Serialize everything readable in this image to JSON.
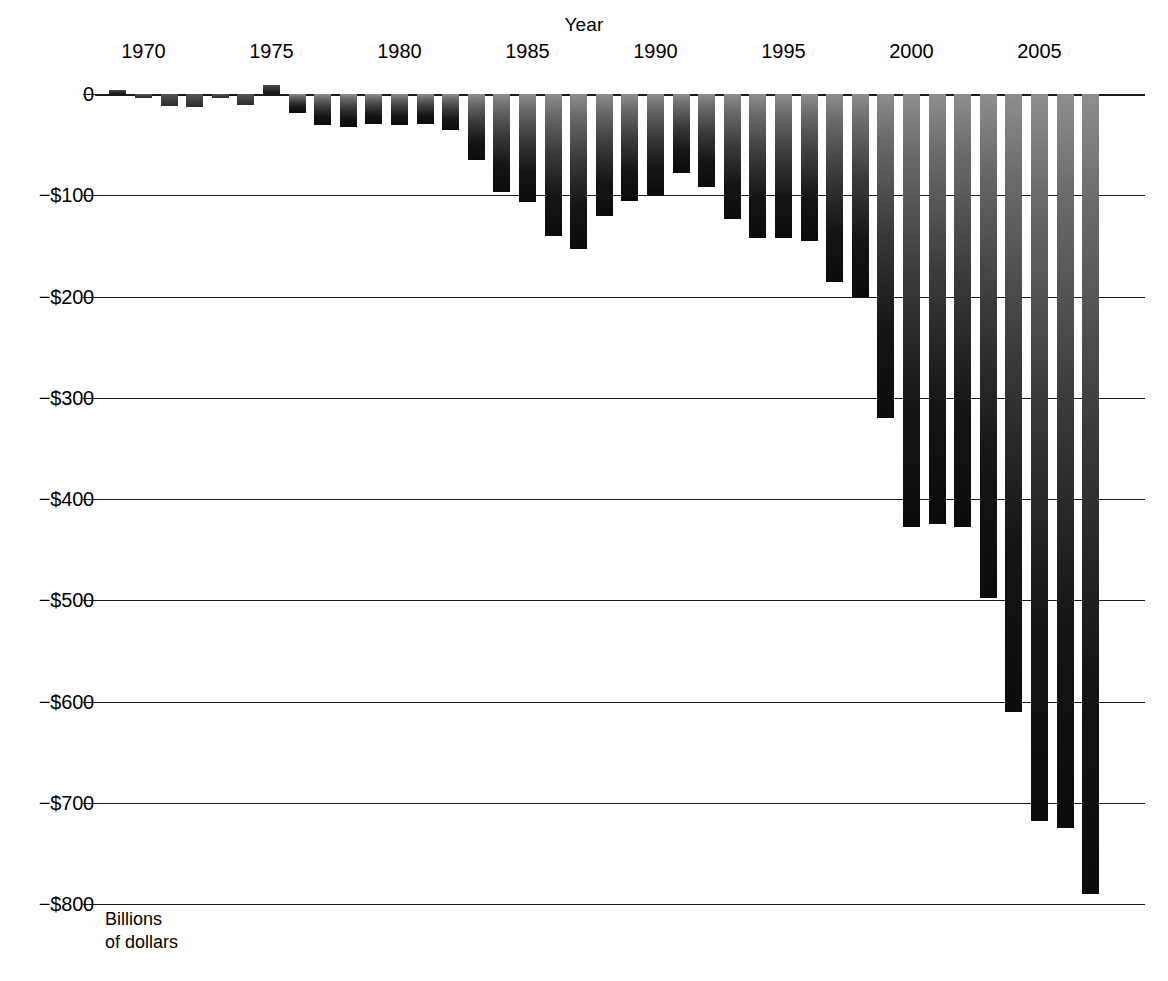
{
  "chart_data": {
    "type": "bar",
    "title": "",
    "xlabel": "Year",
    "ylabel": "Billions\nof dollars",
    "ylim": [
      -800,
      0
    ],
    "xlim": [
      1968.5,
      2007.5
    ],
    "grid": true,
    "legend": false,
    "legend_position": "none",
    "unit": "Billions of dollars",
    "y_ticks": [
      0,
      -100,
      -200,
      -300,
      -400,
      -500,
      -600,
      -700,
      -800
    ],
    "y_tick_labels": [
      "0",
      "−$100",
      "−$200",
      "−$300",
      "−$400",
      "−$500",
      "−$600",
      "−$700",
      "−$800"
    ],
    "x_ticks": [
      1970,
      1975,
      1980,
      1985,
      1990,
      1995,
      2000,
      2005
    ],
    "x_tick_labels": [
      "1970",
      "1975",
      "1980",
      "1985",
      "1990",
      "1995",
      "2000",
      "2005"
    ],
    "categories": [
      1969,
      1970,
      1971,
      1972,
      1973,
      1974,
      1975,
      1976,
      1977,
      1978,
      1979,
      1980,
      1981,
      1982,
      1983,
      1984,
      1985,
      1986,
      1987,
      1988,
      1989,
      1990,
      1991,
      1992,
      1993,
      1994,
      1995,
      1996,
      1997,
      1998,
      1999,
      2000,
      2001,
      2002,
      2003,
      2004,
      2005,
      2006,
      2007
    ],
    "values": [
      3,
      -3,
      -23,
      -23,
      -15,
      -6,
      -53,
      8,
      -54,
      -59,
      -41,
      -74,
      -79,
      -128,
      -208,
      -185,
      -212,
      -221,
      -150,
      -155,
      -153,
      -221,
      -269,
      -290,
      -255,
      -203,
      -164,
      -107,
      -22,
      -69,
      -126,
      -236,
      -128,
      -158,
      -378,
      -413,
      -318,
      -248,
      -163
    ],
    "bar_tops_px": [
      {
        "year": 1969,
        "value": 3
      },
      {
        "year": 1970,
        "value": -3
      },
      {
        "year": 1971,
        "value": -23
      },
      {
        "year": 1972,
        "value": -23
      },
      {
        "year": 1973,
        "value": -15
      },
      {
        "year": 1974,
        "value": -6
      },
      {
        "year": 1975,
        "value": 10
      },
      {
        "year": 1976,
        "value": -20
      }
    ],
    "series": [
      {
        "name": "Federal budget surplus or deficit",
        "values": [
          3,
          -3,
          -23,
          -23,
          -15,
          -6,
          10,
          -20,
          -31,
          -33,
          -28,
          -31,
          -31,
          -66,
          -97,
          -107,
          -140,
          -153,
          -101,
          -98,
          -98,
          -78,
          -112,
          -129,
          -142,
          -142,
          -186,
          -200,
          -320,
          -428,
          -428,
          -428,
          -498,
          -610,
          -716,
          -790,
          -790,
          -790,
          -790
        ]
      }
    ],
    "bars": [
      {
        "year": 1969,
        "value": 3
      },
      {
        "year": 1970,
        "value": -3
      },
      {
        "year": 1971,
        "value": -12
      },
      {
        "year": 1972,
        "value": -13
      },
      {
        "year": 1973,
        "value": -2
      },
      {
        "year": 1974,
        "value": -11
      },
      {
        "year": 1975,
        "value": 9
      },
      {
        "year": 1976,
        "value": -19
      },
      {
        "year": 1977,
        "value": -31
      },
      {
        "year": 1978,
        "value": -33
      },
      {
        "year": 1979,
        "value": -30
      },
      {
        "year": 1980,
        "value": -31
      },
      {
        "year": 1981,
        "value": -30
      },
      {
        "year": 1982,
        "value": -36
      },
      {
        "year": 1983,
        "value": -65
      },
      {
        "year": 1984,
        "value": -97
      },
      {
        "year": 1985,
        "value": -107
      },
      {
        "year": 1986,
        "value": -140
      },
      {
        "year": 1987,
        "value": -153
      },
      {
        "year": 1988,
        "value": -120
      },
      {
        "year": 1989,
        "value": -106
      },
      {
        "year": 1990,
        "value": -101
      },
      {
        "year": 1991,
        "value": -78
      },
      {
        "year": 1992,
        "value": -92
      },
      {
        "year": 1993,
        "value": -123
      },
      {
        "year": 1994,
        "value": -142
      },
      {
        "year": 1995,
        "value": -142
      },
      {
        "year": 1996,
        "value": -145
      },
      {
        "year": 1997,
        "value": -186
      },
      {
        "year": 1998,
        "value": -200
      },
      {
        "year": 1999,
        "value": -320
      },
      {
        "year": 2000,
        "value": -428
      },
      {
        "year": 2001,
        "value": -425
      },
      {
        "year": 2002,
        "value": -428
      },
      {
        "year": 2003,
        "value": -498
      },
      {
        "year": 2004,
        "value": -610
      },
      {
        "year": 2005,
        "value": -718
      },
      {
        "year": 2006,
        "value": -725
      },
      {
        "year": 2007,
        "value": -790
      }
    ]
  },
  "layout": {
    "plot_left_px": 105,
    "plot_right_px": 1140,
    "zero_y_px": 94,
    "px_per_100": 101.25,
    "bar_pitch_px": 25.6,
    "bar_width_px": 17
  },
  "colors": {
    "axis": "#1a1a1a",
    "bar_top": "#8e8e8e",
    "bar_bottom": "#0b0b0b",
    "background": "#ffffff"
  }
}
